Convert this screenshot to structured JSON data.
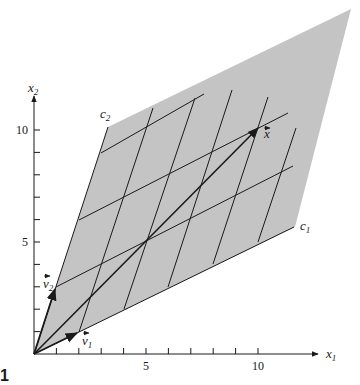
{
  "figure": {
    "type": "coordinate-grid diagram",
    "figure_marker": "1",
    "colors": {
      "background": "#ffffff",
      "region_fill": "#c4c4c4",
      "lines": "#1a1a1a",
      "text": "#1a1a1a"
    }
  },
  "axes": {
    "x_axis": {
      "label": "x",
      "label_sub": "1",
      "tick_labels": [
        {
          "value": 5,
          "text": "5"
        },
        {
          "value": 10,
          "text": "10"
        }
      ],
      "ticks": [
        1,
        2,
        3,
        4,
        5,
        6,
        7,
        8,
        9,
        10
      ]
    },
    "y_axis": {
      "label": "x",
      "label_sub": "2",
      "tick_labels": [
        {
          "value": 5,
          "text": "5"
        },
        {
          "value": 10,
          "text": "10"
        }
      ],
      "ticks": [
        1,
        2,
        3,
        4,
        5,
        6,
        7,
        8,
        9,
        10
      ]
    }
  },
  "basis": {
    "v1": {
      "label": "v",
      "sub": "1",
      "vector": [
        2,
        1
      ]
    },
    "v2": {
      "label": "v",
      "sub": "2",
      "vector": [
        1,
        3
      ]
    }
  },
  "coordinate_lines": {
    "c1": {
      "label": "c",
      "sub": "1"
    },
    "c2": {
      "label": "c",
      "sub": "2"
    }
  },
  "target_vector": {
    "label": "x",
    "vector": [
      10,
      10
    ],
    "coords": {
      "c1": 4,
      "c2": 2
    }
  }
}
